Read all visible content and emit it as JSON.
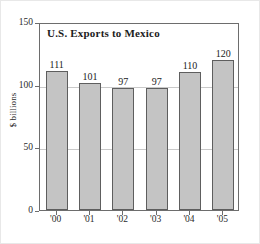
{
  "chart_data": {
    "type": "bar",
    "title": "U.S. Exports to Mexico",
    "xlabel": "",
    "ylabel": "$ billions",
    "categories": [
      "'00",
      "'01",
      "'02",
      "'03",
      "'04",
      "'05"
    ],
    "values": [
      111,
      101,
      97,
      97,
      110,
      120
    ],
    "value_labels": [
      "111",
      "101",
      "97",
      "97",
      "110",
      "120"
    ],
    "ylim": [
      0,
      150
    ],
    "yticks": [
      0,
      50,
      100,
      150
    ],
    "ytick_labels": [
      "0",
      "50",
      "100",
      "150"
    ],
    "grid": "horizontal",
    "gridlines_at": [
      50,
      100
    ],
    "legend": null,
    "colors": {
      "bar_fill": "#c4c4c4",
      "bar_border": "#5e5e5e",
      "frame": "#6d6d6d",
      "gridline": "#c9c9c9",
      "text": "#1c1c1c",
      "background": "#ffffff"
    }
  }
}
